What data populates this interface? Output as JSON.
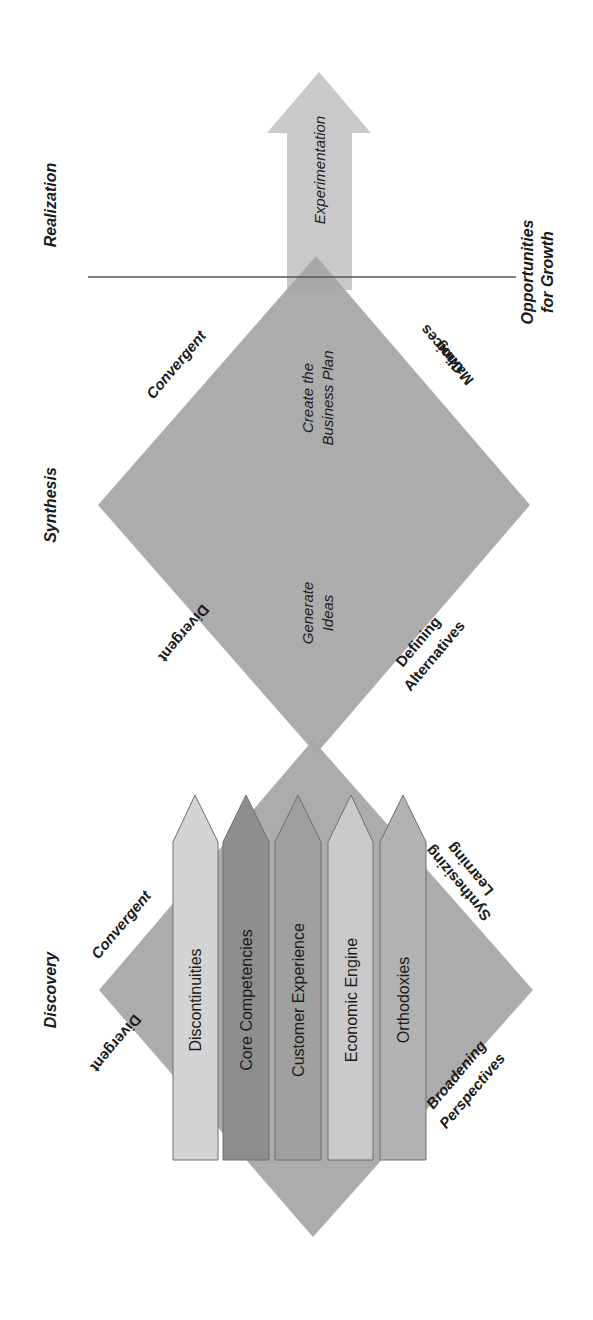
{
  "stages": {
    "discovery": "Discovery",
    "synthesis": "Synthesis",
    "realization": "Realization"
  },
  "threshold_label": {
    "line1": "Opportunities",
    "line2": "for Growth"
  },
  "arrow": {
    "label": "Experimentation"
  },
  "synthesis_diamond": {
    "upper_left": "Convergent",
    "lower_left": "Divergent",
    "upper_right": {
      "line1": "Making",
      "line2": "Choices"
    },
    "lower_right": {
      "line1": "Defining",
      "line2": "Alternatives"
    },
    "inner_top": {
      "line1": "Create the",
      "line2": "Business Plan"
    },
    "inner_bottom": {
      "line1": "Generate",
      "line2": "Ideas"
    }
  },
  "discovery_diamond": {
    "upper_left": "Convergent",
    "lower_left": "Divergent",
    "upper_right": {
      "line1": "Synthesizing",
      "line2": "Learning"
    },
    "lower_right": {
      "line1": "Broadening",
      "line2": "Perspectives"
    }
  },
  "lenses": [
    {
      "label": "Discontinuities",
      "color": "#d4d4d4"
    },
    {
      "label": "Core Competencies",
      "color": "#8e8e8e"
    },
    {
      "label": "Customer Experience",
      "color": "#a0a0a0"
    },
    {
      "label": "Economic Engine",
      "color": "#cacaca"
    },
    {
      "label": "Orthodoxies",
      "color": "#b2b2b2"
    }
  ],
  "colors": {
    "diamond": "#a8a8a8",
    "arrow": "#c9c9c9",
    "line": "#555555",
    "lens_border": "#6e6e6e"
  }
}
